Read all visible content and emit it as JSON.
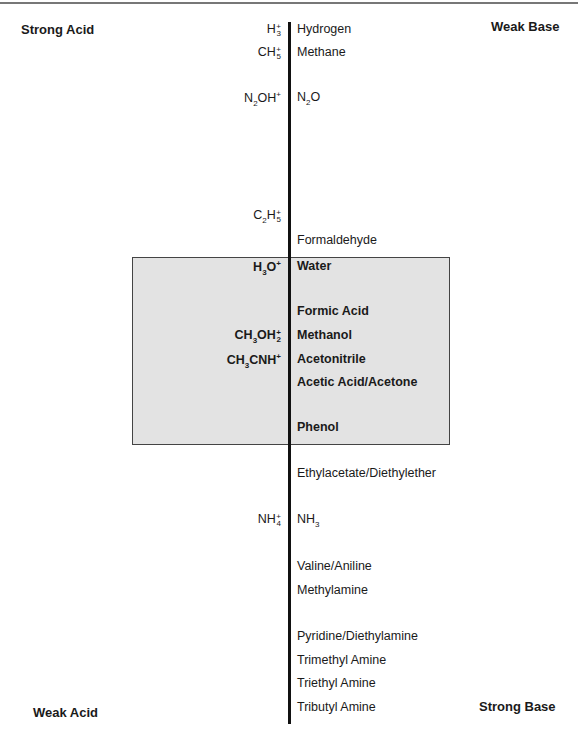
{
  "corners": {
    "top_left": "Strong Acid",
    "top_right": "Weak Base",
    "bottom_left": "Weak Acid",
    "bottom_right": "Strong Base"
  },
  "acids": [
    {
      "id": "h3",
      "base": "H",
      "sub": "3",
      "sup": "+",
      "y": 23,
      "bold": false
    },
    {
      "id": "ch5",
      "base": "CH",
      "sub": "5",
      "sup": "+",
      "y": 46,
      "bold": false
    },
    {
      "id": "n2oh",
      "parts": [
        "N",
        "2",
        "OH"
      ],
      "sup": "+",
      "y": 91,
      "bold": false
    },
    {
      "id": "c2h5",
      "parts": [
        "C",
        "2",
        "H"
      ],
      "sub": "5",
      "sup": "+",
      "y": 209,
      "bold": false
    },
    {
      "id": "h3o",
      "parts": [
        "H",
        "3",
        "O"
      ],
      "sup": "+",
      "y": 260,
      "bold": true
    },
    {
      "id": "ch3oh2",
      "parts": [
        "CH",
        "3",
        "OH"
      ],
      "sub": "2",
      "sup": "+",
      "y": 329,
      "bold": true
    },
    {
      "id": "ch3cnh",
      "parts": [
        "CH",
        "3",
        "CNH"
      ],
      "sup": "+",
      "y": 353,
      "bold": true
    },
    {
      "id": "nh4",
      "base": "NH",
      "sub": "4",
      "sup": "+",
      "y": 513,
      "bold": false
    }
  ],
  "bases": [
    {
      "label": "Hydrogen",
      "y": 23,
      "bold": false
    },
    {
      "label": "Methane",
      "y": 46,
      "bold": false
    },
    {
      "label_parts": [
        "N",
        "2",
        "O"
      ],
      "y": 91,
      "bold": false
    },
    {
      "label": "Formaldehyde",
      "y": 234,
      "bold": false
    },
    {
      "label": "Water",
      "y": 260,
      "bold": true
    },
    {
      "label": "Formic Acid",
      "y": 305,
      "bold": true
    },
    {
      "label": "Methanol",
      "y": 329,
      "bold": true
    },
    {
      "label": "Acetonitrile",
      "y": 353,
      "bold": true
    },
    {
      "label": "Acetic Acid/Acetone",
      "y": 376,
      "bold": true
    },
    {
      "label": "Phenol",
      "y": 421,
      "bold": true
    },
    {
      "label": "Ethylacetate/Diethylether",
      "y": 467,
      "bold": false
    },
    {
      "label_parts": [
        "NH",
        "3",
        ""
      ],
      "y": 513,
      "bold": false
    },
    {
      "label": "Valine/Aniline",
      "y": 560,
      "bold": false
    },
    {
      "label": "Methylamine",
      "y": 584,
      "bold": false
    },
    {
      "label": "Pyridine/Diethylamine",
      "y": 630,
      "bold": false
    },
    {
      "label": "Trimethyl Amine",
      "y": 654,
      "bold": false
    },
    {
      "label": "Triethyl Amine",
      "y": 677,
      "bold": false
    },
    {
      "label": "Tributyl Amine",
      "y": 701,
      "bold": false
    }
  ],
  "colors": {
    "highlight_box": "#e3e3e3",
    "axis": "#111111"
  }
}
